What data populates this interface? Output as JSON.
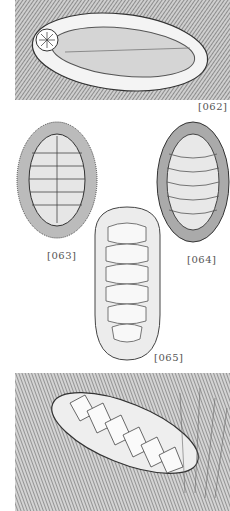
{
  "plate": {
    "background": "#ffffff",
    "ink": "#3a3a3a",
    "figures": [
      {
        "id": "062",
        "label": "[062]",
        "subject": "chiton ventral view on rock"
      },
      {
        "id": "063",
        "label": "[063]",
        "subject": "spiny chiton dorsal view"
      },
      {
        "id": "064",
        "label": "[064]",
        "subject": "scaled chiton dorsal view"
      },
      {
        "id": "065",
        "label": "[065]",
        "subject": "granular chiton dorsal view"
      },
      {
        "id": "066",
        "label": "",
        "subject": "chiton on rock among seaweed"
      }
    ]
  }
}
